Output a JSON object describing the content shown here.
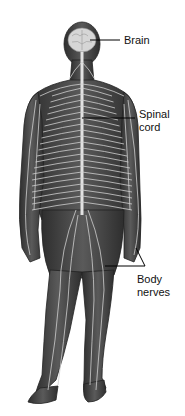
{
  "diagram": {
    "colors": {
      "body": "#4a4a4a",
      "body_dark": "#2e2e2e",
      "nerve": "#cfcfcf",
      "spine": "#e2e2e2",
      "brain": "#d6d6d6",
      "leader_line": "#000000",
      "label_text": "#111111",
      "background": "#ffffff"
    },
    "labels": [
      {
        "id": "brain",
        "text": "Brain",
        "lines": [
          "Brain"
        ]
      },
      {
        "id": "spinal-cord",
        "text": "Spinal cord",
        "lines": [
          "Spinal",
          "cord"
        ]
      },
      {
        "id": "body-nerves",
        "text": "Body nerves",
        "lines": [
          "Body",
          "nerves"
        ]
      }
    ]
  }
}
